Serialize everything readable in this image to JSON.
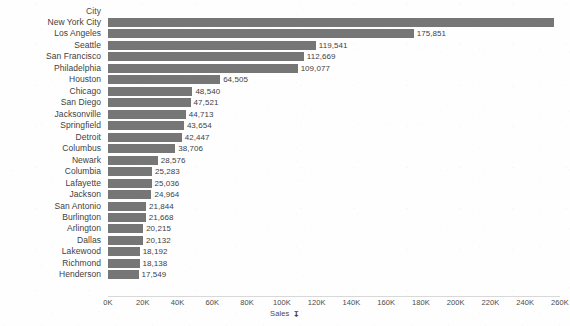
{
  "chart_data": {
    "type": "bar",
    "orientation": "horizontal",
    "title": "",
    "xlabel": "Sales",
    "ylabel": "City",
    "categories": [
      "New York City",
      "Los Angeles",
      "Seattle",
      "San Francisco",
      "Philadelphia",
      "Houston",
      "Chicago",
      "San Diego",
      "Jacksonville",
      "Springfield",
      "Detroit",
      "Columbus",
      "Newark",
      "Columbia",
      "Lafayette",
      "Jackson",
      "San Antonio",
      "Burlington",
      "Arlington",
      "Dallas",
      "Lakewood",
      "Richmond",
      "Henderson"
    ],
    "values": [
      256368,
      175851,
      119541,
      112669,
      109077,
      64505,
      48540,
      47521,
      44713,
      43654,
      42447,
      38706,
      28576,
      25283,
      25036,
      24964,
      21844,
      21668,
      20215,
      20132,
      18192,
      18138,
      17549
    ],
    "value_labels": [
      "256,368",
      "175,851",
      "119,541",
      "112,669",
      "109,077",
      "64,505",
      "48,540",
      "47,521",
      "44,713",
      "43,654",
      "42,447",
      "38,706",
      "28,576",
      "25,283",
      "25,036",
      "24,964",
      "21,844",
      "21,668",
      "20,215",
      "20,132",
      "18,192",
      "18,138",
      "17,549"
    ],
    "xlim": [
      0,
      260000
    ],
    "xticks": [
      0,
      20000,
      40000,
      60000,
      80000,
      100000,
      120000,
      140000,
      160000,
      180000,
      200000,
      220000,
      240000,
      260000
    ],
    "xtick_labels": [
      "0K",
      "20K",
      "40K",
      "60K",
      "80K",
      "100K",
      "120K",
      "140K",
      "160K",
      "180K",
      "200K",
      "220K",
      "240K",
      "260K"
    ],
    "grid": false,
    "legend": "none",
    "bar_color": "#767676",
    "sort": "descending"
  },
  "header": {
    "category_column_label": "City"
  },
  "axis": {
    "title": "Sales",
    "sort_icon": "sort-descending-icon",
    "sort_glyph": "↧"
  }
}
